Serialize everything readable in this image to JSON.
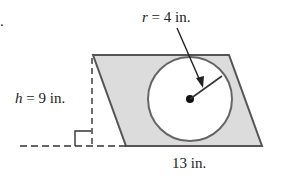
{
  "figure": {
    "radius_label_var": "r",
    "radius_label_rest": " = 4 in.",
    "height_label_var": "h",
    "height_label_rest": " = 9 in.",
    "base_label": "13 in.",
    "bullet": "."
  },
  "colors": {
    "shape_fill": "#dcdcdc",
    "stroke": "#555555",
    "circle_fill": "#ffffff",
    "text": "#222222"
  }
}
